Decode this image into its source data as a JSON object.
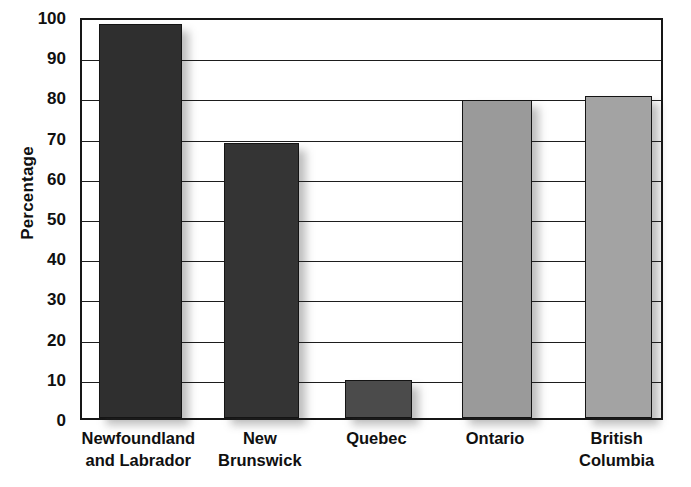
{
  "chart_data": {
    "type": "bar",
    "title": "",
    "xlabel": "",
    "ylabel": "Percentage",
    "ylim": [
      0,
      100
    ],
    "ytick_step": 10,
    "grid": true,
    "legend": null,
    "categories": [
      "Newfoundland and Labrador",
      "New Brunswick",
      "Quebec",
      "Ontario",
      "British Columbia"
    ],
    "values": [
      98,
      68.5,
      9.5,
      79,
      80
    ],
    "yticks": [
      0,
      10,
      20,
      30,
      40,
      50,
      60,
      70,
      80,
      90,
      100
    ],
    "ytick_labels": [
      "0",
      "10",
      "20",
      "30",
      "40",
      "50",
      "60",
      "70",
      "80",
      "90",
      "100"
    ],
    "bars": [
      {
        "label_lines": [
          "Newfoundland",
          "and Labrador"
        ],
        "value": 98,
        "color": "#2f2f2f",
        "left_pct": 2.9,
        "width_pct": 14.2
      },
      {
        "label_lines": [
          "New",
          "Brunswick"
        ],
        "value": 68.5,
        "color": "#343434",
        "left_pct": 24.4,
        "width_pct": 12.9
      },
      {
        "label_lines": [
          "Quebec"
        ],
        "value": 9.5,
        "color": "#4b4b4b",
        "left_pct": 45.1,
        "width_pct": 11.5
      },
      {
        "label_lines": [
          "Ontario"
        ],
        "value": 79,
        "color": "#9a9a9a",
        "left_pct": 65.2,
        "width_pct": 12.0
      },
      {
        "label_lines": [
          "British",
          "Columbia"
        ],
        "value": 80,
        "color": "#a3a3a3",
        "left_pct": 86.3,
        "width_pct": 11.5
      }
    ],
    "colors": {
      "axis": "#161616",
      "grid": "#1d1d1d",
      "background": "#ffffff",
      "bar_dark": "#2f2f2f",
      "bar_light": "#9e9e9e"
    }
  }
}
